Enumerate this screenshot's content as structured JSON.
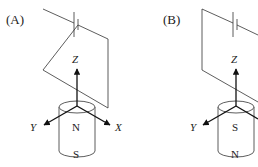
{
  "panels": [
    {
      "label": "(A)",
      "axes": {
        "z": "Z",
        "y": "Y",
        "x": "X"
      },
      "magnet": {
        "top_pole": "N",
        "bottom_pole": "S"
      }
    },
    {
      "label": "(B)",
      "axes": {
        "z": "Z",
        "y": "Y"
      },
      "magnet": {
        "top_pole": "S",
        "bottom_pole": "N"
      }
    }
  ],
  "colors": {
    "line": "#333333",
    "text": "#222222",
    "background": "#ffffff"
  }
}
